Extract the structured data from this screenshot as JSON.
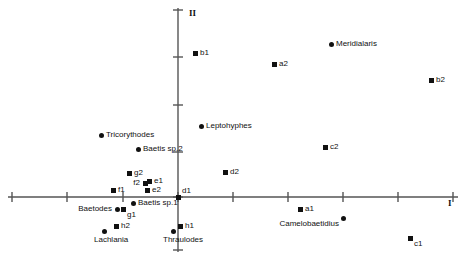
{
  "chart_data": {
    "type": "scatter",
    "title": "",
    "xlabel": "I",
    "ylabel": "II",
    "grid": false,
    "legend": null,
    "axis_style": "centered-cross",
    "xlim": [
      -3.0,
      5.0
    ],
    "ylim": [
      -4.0,
      4.0
    ],
    "xticks": [
      -3.0,
      -2.0,
      -1.0,
      0.0,
      1.0,
      2.0,
      3.0,
      4.0,
      5.0
    ],
    "yticks": [
      -4.0,
      -3.0,
      0.0,
      1.0,
      2.0,
      3.0,
      4.0
    ],
    "series": [
      {
        "name": "samples",
        "marker": "square",
        "points": [
          {
            "label": "b1",
            "x": -0.6,
            "y": 2.68,
            "px": 195,
            "py": 53,
            "label_pos": "right"
          },
          {
            "label": "a2",
            "x": 1.12,
            "y": 2.48,
            "px": 274,
            "py": 64,
            "label_pos": "right"
          },
          {
            "label": "b2",
            "x": 4.2,
            "y": 2.16,
            "px": 431,
            "py": 80,
            "label_pos": "right"
          },
          {
            "label": "c2",
            "x": 2.62,
            "y": 1.08,
            "px": 325,
            "py": 147,
            "label_pos": "right"
          },
          {
            "label": "g2",
            "x": -1.02,
            "y": 0.4,
            "px": 129,
            "py": 173,
            "label_pos": "right"
          },
          {
            "label": "f2",
            "x": -0.78,
            "y": 0.17,
            "px": 145,
            "py": 183,
            "label_pos": "left"
          },
          {
            "label": "e1",
            "x": -0.72,
            "y": 0.21,
            "px": 149,
            "py": 181,
            "label_pos": "right"
          },
          {
            "label": "e2",
            "x": -0.75,
            "y": 0.02,
            "px": 147,
            "py": 190,
            "label_pos": "right"
          },
          {
            "label": "f1",
            "x": -1.6,
            "y": 0.05,
            "px": 113,
            "py": 190,
            "label_pos": "right"
          },
          {
            "label": "d1",
            "x": 0.0,
            "y": 0.0,
            "px": 178,
            "py": 197,
            "label_pos": "above"
          },
          {
            "label": "d2",
            "x": 0.96,
            "y": 0.58,
            "px": 225,
            "py": 172,
            "label_pos": "right"
          },
          {
            "label": "g1",
            "x": -1.16,
            "y": -0.27,
            "px": 123,
            "py": 209,
            "label_pos": "below"
          },
          {
            "label": "h2",
            "x": -1.5,
            "y": -0.6,
            "px": 116,
            "py": 226,
            "label_pos": "right"
          },
          {
            "label": "h1",
            "x": 0.06,
            "y": -0.6,
            "px": 180,
            "py": 226,
            "label_pos": "right"
          },
          {
            "label": "a1",
            "x": 1.5,
            "y": -0.03,
            "px": 300,
            "py": 209,
            "label_pos": "right"
          },
          {
            "label": "c1",
            "x": 3.8,
            "y": -0.72,
            "px": 410,
            "py": 238,
            "label_pos": "below"
          }
        ]
      },
      {
        "name": "taxa",
        "marker": "circle",
        "points": [
          {
            "label": "Meridialaris",
            "x": 2.12,
            "y": 2.92,
            "px": 331,
            "py": 44,
            "label_pos": "right"
          },
          {
            "label": "Leptohyphes",
            "x": 0.4,
            "y": 1.64,
            "px": 201,
            "py": 126,
            "label_pos": "right"
          },
          {
            "label": "Tricorythodes",
            "x": -1.78,
            "y": 1.36,
            "px": 101,
            "py": 135,
            "label_pos": "right"
          },
          {
            "label": "Baetis sp.2",
            "x": -0.86,
            "y": 1.08,
            "px": 138,
            "py": 149,
            "label_pos": "right"
          },
          {
            "label": "Baetis sp.1",
            "x": -0.88,
            "y": -0.16,
            "px": 133,
            "py": 203,
            "label_pos": "right"
          },
          {
            "label": "Baetodes",
            "x": -1.2,
            "y": -0.28,
            "px": 117,
            "py": 209,
            "label_pos": "left"
          },
          {
            "label": "Lachlania",
            "x": -1.7,
            "y": -0.68,
            "px": 104,
            "py": 231,
            "label_pos": "under"
          },
          {
            "label": "Thraulodes",
            "x": 0.0,
            "y": -0.7,
            "px": 173,
            "py": 231,
            "label_pos": "under"
          },
          {
            "label": "Camelobaetidius",
            "x": 1.84,
            "y": -0.3,
            "px": 343,
            "py": 218,
            "label_pos": "belowl"
          }
        ]
      }
    ]
  },
  "axes": {
    "x_label": "I",
    "y_label": "II",
    "x_label_px": {
      "x": 448,
      "y": 198
    },
    "y_label_px": {
      "x": 189,
      "y": 8
    },
    "x_line": {
      "x1": 8,
      "x2": 458,
      "y": 197
    },
    "y_line": {
      "x1": 178,
      "y1": 8,
      "y2": 252
    },
    "x_tick_px": [
      12,
      67,
      123,
      178,
      233,
      288,
      343,
      398,
      453
    ],
    "y_tick_px": [
      10,
      57,
      105,
      152,
      197,
      250
    ],
    "color": "#555555",
    "tick_len": 5
  },
  "colors": {
    "marker": "#111111",
    "axis": "#555555",
    "background": "#ffffff",
    "text": "#111111"
  }
}
